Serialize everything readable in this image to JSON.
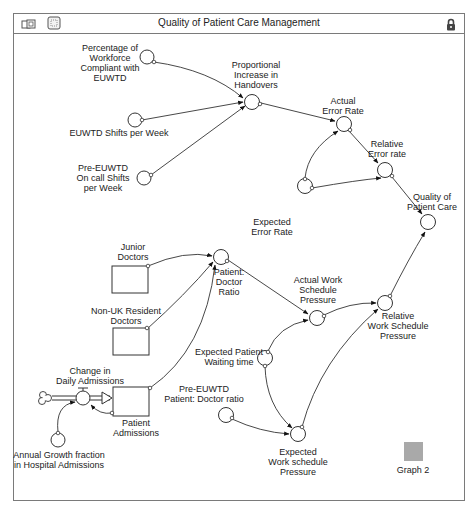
{
  "window": {
    "title": "Quality of Patient Care Management",
    "icons": [
      "map-view-icon",
      "model-view-icon",
      "lock-icon"
    ]
  },
  "diagram": {
    "converters": {
      "percentage_compliant": [
        "Percentage of",
        "Workforce",
        "Compliant with",
        "EUWTD"
      ],
      "euwtd_shifts": [
        "EUWTD Shifts per Week"
      ],
      "pre_euwtd_oncall": [
        "Pre-EUWTD",
        "On call Shifts",
        "per Week"
      ],
      "proportional_increase": [
        "Proportional",
        "Increase in",
        "Handovers"
      ],
      "actual_error_rate": [
        "Actual",
        "Error Rate"
      ],
      "relative_error_rate": [
        "Relative",
        "Error rate"
      ],
      "quality_patient_care": [
        "Quality of",
        "Patient Care"
      ],
      "expected_error_rate": [
        "Expected",
        "Error Rate"
      ],
      "patient_doctor_ratio": [
        "Patient:",
        "Doctor",
        "Ratio"
      ],
      "actual_work_schedule": [
        "Actual Work",
        "Schedule",
        "Pressure"
      ],
      "relative_work_schedule": [
        "Relative",
        "Work Schedule",
        "Pressure"
      ],
      "expected_patient_waiting": [
        "Expected Patient",
        "Waiting time"
      ],
      "pre_euwtd_patient_doctor": [
        "Pre-EUWTD",
        "Patient: Doctor ratio"
      ],
      "expected_work_schedule": [
        "Expected",
        "Work schedule",
        "Pressure"
      ],
      "annual_growth": [
        "Annual Growth fraction",
        "in Hospital Admissions"
      ]
    },
    "stocks": {
      "junior_doctors": [
        "Junior",
        "Doctors"
      ],
      "non_uk_doctors": [
        "Non-UK Resident",
        "Doctors"
      ],
      "patient_admissions": [
        "Patient",
        "Admissions"
      ]
    },
    "flows": {
      "change_daily_admissions": [
        "Change in",
        "Daily Admissions"
      ]
    },
    "graph": {
      "label": "Graph 2",
      "color": "#a9a9a9"
    }
  }
}
